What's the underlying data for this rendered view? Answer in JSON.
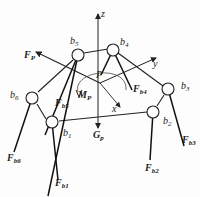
{
  "diagram": {
    "axes": {
      "z": "z",
      "y": "y",
      "x": "x"
    },
    "center_label": "P",
    "moment_label": {
      "main": "M",
      "sub": "P"
    },
    "force_label": {
      "main": "F",
      "sub": "P"
    },
    "gravity_label": {
      "main": "G",
      "sub": "p"
    },
    "joints": [
      {
        "id": "b1",
        "main": "b",
        "sub": "1"
      },
      {
        "id": "b2",
        "main": "b",
        "sub": "2"
      },
      {
        "id": "b3",
        "main": "b",
        "sub": "3"
      },
      {
        "id": "b4",
        "main": "b",
        "sub": "4"
      },
      {
        "id": "b5",
        "main": "b",
        "sub": "5"
      },
      {
        "id": "b6",
        "main": "b",
        "sub": "6"
      }
    ],
    "leg_forces": [
      {
        "id": "Fb1",
        "main": "F",
        "sub": "b1"
      },
      {
        "id": "Fb2",
        "main": "F",
        "sub": "b2"
      },
      {
        "id": "Fb3",
        "main": "F",
        "sub": "b3"
      },
      {
        "id": "Fb4",
        "main": "F",
        "sub": "b4"
      },
      {
        "id": "Fb5",
        "main": "F",
        "sub": "b5"
      },
      {
        "id": "Fb6",
        "main": "F",
        "sub": "b6"
      }
    ],
    "colors": {
      "line": "#222222",
      "background": "#fdfdfd"
    }
  }
}
